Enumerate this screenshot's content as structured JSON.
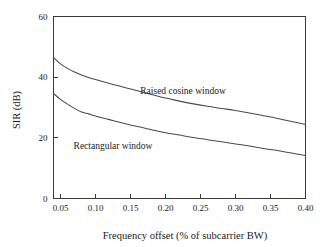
{
  "chart_data": {
    "type": "line",
    "title": "",
    "xlabel": "Frequency offset (% of subcarrier BW)",
    "ylabel": "SIR (dB)",
    "xlim": [
      0.04,
      0.4
    ],
    "ylim": [
      0,
      60
    ],
    "xticks": [
      0.05,
      0.1,
      0.15,
      0.2,
      0.25,
      0.3,
      0.35,
      0.4
    ],
    "xtick_labels": [
      "0.05",
      "0.10",
      "0.15",
      "0.20",
      "0.25",
      "0.30",
      "0.35",
      "0.40"
    ],
    "yticks": [
      0,
      20,
      40,
      60
    ],
    "ytick_labels": [
      "0",
      "20",
      "40",
      "60"
    ],
    "grid": false,
    "legend_position": "inline-annotation",
    "series": [
      {
        "name": "Raised cosine window",
        "label_x": 0.225,
        "label_y": 34.5,
        "x": [
          0.04,
          0.05,
          0.06,
          0.07,
          0.08,
          0.09,
          0.1,
          0.12,
          0.14,
          0.16,
          0.18,
          0.2,
          0.22,
          0.24,
          0.26,
          0.28,
          0.3,
          0.32,
          0.34,
          0.36,
          0.38,
          0.4
        ],
        "y": [
          46.5,
          44.4,
          42.9,
          41.7,
          40.7,
          39.9,
          39.2,
          37.9,
          36.7,
          35.5,
          34.3,
          33.1,
          32.1,
          31.2,
          30.4,
          29.7,
          29.0,
          28.2,
          27.3,
          26.4,
          25.4,
          24.4
        ]
      },
      {
        "name": "Rectangular window",
        "label_x": 0.125,
        "label_y": 16.2,
        "x": [
          0.04,
          0.05,
          0.06,
          0.07,
          0.08,
          0.09,
          0.1,
          0.12,
          0.14,
          0.16,
          0.18,
          0.2,
          0.22,
          0.24,
          0.26,
          0.28,
          0.3,
          0.32,
          0.34,
          0.36,
          0.38,
          0.4
        ],
        "y": [
          34.6,
          32.7,
          31.1,
          29.7,
          28.5,
          27.9,
          27.2,
          26.0,
          24.8,
          23.7,
          22.7,
          21.7,
          20.9,
          20.1,
          19.4,
          18.7,
          18.0,
          17.3,
          16.5,
          15.8,
          15.0,
          14.2
        ]
      }
    ]
  },
  "colors": {
    "background": "#ffffff",
    "axis": "#3a3a3a",
    "curve": "#4a4a4a",
    "text": "#1a1a1a"
  }
}
